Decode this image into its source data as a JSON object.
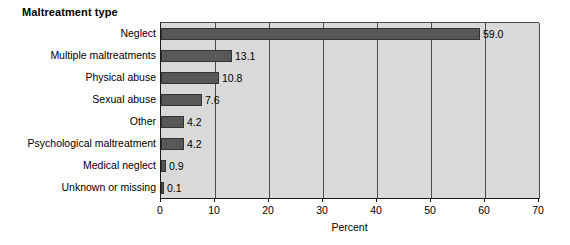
{
  "chart_data": {
    "type": "bar",
    "orientation": "horizontal",
    "title": "Maltreatment type",
    "xlabel": "Percent",
    "ylabel": "",
    "xlim": [
      0,
      70
    ],
    "xticks": [
      0,
      10,
      20,
      30,
      40,
      50,
      60,
      70
    ],
    "xtick_labels": [
      "0",
      "10",
      "20",
      "30",
      "40",
      "50",
      "60",
      "70"
    ],
    "grid": true,
    "grid_axis": "x",
    "legend": false,
    "categories": [
      "Neglect",
      "Multiple maltreatments",
      "Physical abuse",
      "Sexual abuse",
      "Other",
      "Psychological maltreatment",
      "Medical neglect",
      "Unknown or missing"
    ],
    "values": [
      59.0,
      13.1,
      10.8,
      7.6,
      4.2,
      4.2,
      0.9,
      0.1
    ],
    "value_labels": [
      "59.0",
      "13.1",
      "10.8",
      "7.6",
      "4.2",
      "4.2",
      "0.9",
      "0.1"
    ],
    "colors": {
      "bar_fill": "#585858",
      "bar_edge": "#343434",
      "plot_background": "#d9d9d9",
      "gridline": "#4a4a4a",
      "axis": "#1a1a1a",
      "text": "#000000",
      "figure_background": "#ffffff"
    }
  }
}
